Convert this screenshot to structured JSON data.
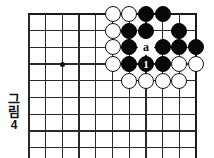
{
  "caption": {
    "text_chars": [
      "그",
      "림"
    ],
    "number": "4"
  },
  "board": {
    "origin_x": 29,
    "origin_y": 14,
    "spacing": 16.7,
    "cols": 11,
    "rows": 9,
    "star_point": {
      "col": 2,
      "row": 3
    },
    "edges": {
      "top": true,
      "left": false,
      "right": true,
      "bottom": false
    }
  },
  "chart_data": {
    "type": "diagram",
    "grid": {
      "columns": 11,
      "rows": 9,
      "spacing_px": 16.7
    },
    "stones": [
      {
        "col": 5,
        "row": 0,
        "color": "white",
        "label": ""
      },
      {
        "col": 6,
        "row": 0,
        "color": "white",
        "label": ""
      },
      {
        "col": 7,
        "row": 0,
        "color": "black",
        "label": ""
      },
      {
        "col": 8,
        "row": 0,
        "color": "black",
        "label": ""
      },
      {
        "col": 5,
        "row": 1,
        "color": "white",
        "label": ""
      },
      {
        "col": 6,
        "row": 1,
        "color": "black",
        "label": ""
      },
      {
        "col": 7,
        "row": 1,
        "color": "black",
        "label": ""
      },
      {
        "col": 9,
        "row": 1,
        "color": "black",
        "label": ""
      },
      {
        "col": 5,
        "row": 2,
        "color": "white",
        "label": ""
      },
      {
        "col": 6,
        "row": 2,
        "color": "black",
        "label": ""
      },
      {
        "col": 8,
        "row": 2,
        "color": "black",
        "label": ""
      },
      {
        "col": 9,
        "row": 2,
        "color": "black",
        "label": ""
      },
      {
        "col": 10,
        "row": 2,
        "color": "black",
        "label": ""
      },
      {
        "col": 5,
        "row": 3,
        "color": "white",
        "label": ""
      },
      {
        "col": 6,
        "row": 3,
        "color": "black",
        "label": ""
      },
      {
        "col": 7,
        "row": 3,
        "color": "black",
        "label": "1"
      },
      {
        "col": 8,
        "row": 3,
        "color": "black",
        "label": ""
      },
      {
        "col": 9,
        "row": 3,
        "color": "white",
        "label": ""
      },
      {
        "col": 10,
        "row": 3,
        "color": "white",
        "label": ""
      },
      {
        "col": 6,
        "row": 4,
        "color": "white",
        "label": ""
      },
      {
        "col": 7,
        "row": 4,
        "color": "white",
        "label": ""
      },
      {
        "col": 8,
        "row": 4,
        "color": "white",
        "label": ""
      },
      {
        "col": 9,
        "row": 4,
        "color": "white",
        "label": ""
      }
    ],
    "markers": [
      {
        "col": 7,
        "row": 2,
        "label": "a"
      }
    ]
  },
  "colors": {
    "black_stone": "#080808",
    "white_stone": "#ffffff",
    "grid_line": "#2a2a2a",
    "border": "#1a1a1a",
    "background": "#ffffff"
  }
}
